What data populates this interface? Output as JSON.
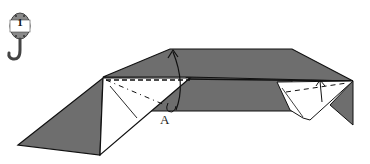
{
  "step": {
    "number": "1",
    "icon": "hook-weight-icon"
  },
  "labels": {
    "point_a": "A"
  },
  "colors": {
    "paper_colored": "#6e6e6e",
    "paper_white": "#ffffff",
    "line": "#111111"
  }
}
